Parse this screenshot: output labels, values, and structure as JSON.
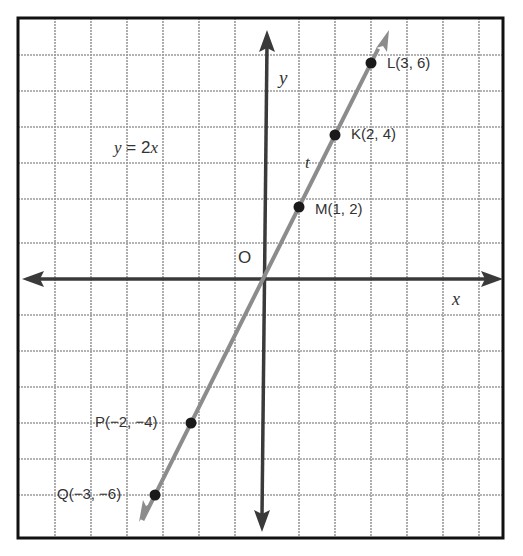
{
  "diagram": {
    "type": "coordinate-plane",
    "frame": {
      "x1": 18,
      "y1": 18,
      "x2": 503,
      "y2": 538
    },
    "origin_px": {
      "x": 263,
      "y": 279
    },
    "unit_px": 36,
    "grid": {
      "vertical_x": [
        55,
        91,
        127,
        163,
        199,
        235,
        299,
        335,
        371,
        407,
        443,
        479
      ],
      "horizontal_y": [
        55,
        91,
        127,
        163,
        199,
        243,
        315,
        351,
        387,
        423,
        459,
        495
      ]
    },
    "colors": {
      "frame": "#111111",
      "grid": "#9a9a9a",
      "axis": "#3a3a3a",
      "line": "#8c8c8c",
      "point": "#1a1a1a",
      "text": "#333333"
    }
  },
  "labels": {
    "origin": "O",
    "x_axis": "x",
    "y_axis": "y",
    "equation": "y = 2x",
    "equation_lhs": "y",
    "equation_rhs": " = 2",
    "equation_var": "x",
    "line_name": "t"
  },
  "points": [
    {
      "name": "L",
      "label": "L(3, 6)",
      "x": 3,
      "y": 6
    },
    {
      "name": "K",
      "label": "K(2, 4)",
      "x": 2,
      "y": 4
    },
    {
      "name": "M",
      "label": "M(1, 2)",
      "x": 1,
      "y": 2
    },
    {
      "name": "P",
      "label": "P(−2, −4)",
      "x": -2,
      "y": -4
    },
    {
      "name": "Q",
      "label": "Q(−3, −6)",
      "x": -3,
      "y": -6
    }
  ]
}
